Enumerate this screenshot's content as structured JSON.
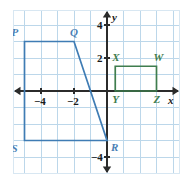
{
  "figure": {
    "type": "coordinate-plane-geometry",
    "background_color": "#ffffff",
    "grid_color": "#bcd7ea",
    "grid_border_color": "#d8e7f2",
    "axis_color": "#2b2b2b",
    "blue_color": "#3f7cb4",
    "green_color": "#3f7d4e"
  },
  "axes": {
    "x_label": "x",
    "y_label": "y",
    "x_ticks": [
      {
        "label": "−4",
        "value": -4
      },
      {
        "label": "−2",
        "value": -2
      }
    ],
    "y_ticks": [
      {
        "label": "4",
        "value": 4
      },
      {
        "label": "2",
        "value": 2
      },
      {
        "label": "−4",
        "value": -4
      }
    ],
    "x_range": [
      -6,
      4
    ],
    "y_range": [
      -5,
      5
    ],
    "unit_px": 16.5,
    "origin_px": {
      "x": 94,
      "y": 81
    }
  },
  "shapes": [
    {
      "name": "quadrilateral-PQRS",
      "color": "#3f7cb4",
      "filled": false,
      "vertices": [
        {
          "label": "P",
          "x": -5,
          "y": 3
        },
        {
          "label": "Q",
          "x": -2,
          "y": 3
        },
        {
          "label": "R",
          "x": 0,
          "y": -3
        },
        {
          "label": "S",
          "x": -5,
          "y": -3
        }
      ],
      "vertex_labels": [
        {
          "label": "P",
          "x": -5,
          "y": 3,
          "offset_x": -13,
          "offset_y": -15
        },
        {
          "label": "Q",
          "x": -2,
          "y": 3,
          "offset_x": -4,
          "offset_y": -15
        },
        {
          "label": "R",
          "x": 0,
          "y": -3,
          "offset_x": 4,
          "offset_y": 1
        },
        {
          "label": "S",
          "x": -5,
          "y": -3,
          "offset_x": -13,
          "offset_y": 2
        }
      ]
    },
    {
      "name": "quadrilateral-XWZY",
      "color": "#3f7d4e",
      "filled": false,
      "vertices": [
        {
          "label": "X",
          "x": 0.5,
          "y": 1.5
        },
        {
          "label": "W",
          "x": 3,
          "y": 1.5
        },
        {
          "label": "Z",
          "x": 3,
          "y": 0
        },
        {
          "label": "Y",
          "x": 0.5,
          "y": 0
        }
      ],
      "vertex_labels": [
        {
          "label": "X",
          "x": 0.5,
          "y": 1.5,
          "offset_x": -3,
          "offset_y": -14
        },
        {
          "label": "W",
          "x": 3,
          "y": 1.5,
          "offset_x": -3,
          "offset_y": -14
        },
        {
          "label": "Z",
          "x": 3,
          "y": 0,
          "offset_x": -3,
          "offset_y": 3
        },
        {
          "label": "Y",
          "x": 0.5,
          "y": 0,
          "offset_x": -3,
          "offset_y": 3
        }
      ]
    }
  ]
}
